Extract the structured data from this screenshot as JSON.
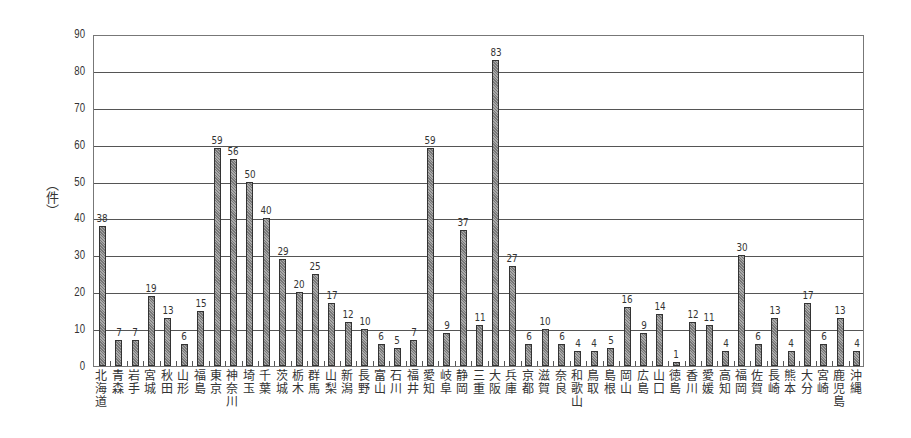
{
  "chart_data": {
    "type": "bar",
    "title": "",
    "xlabel": "",
    "ylabel": "（件）",
    "ylim": [
      0,
      90
    ],
    "yticks": [
      0,
      10,
      20,
      30,
      40,
      50,
      60,
      70,
      80,
      90
    ],
    "grid": true,
    "legend": null,
    "categories": [
      "北海道",
      "青森",
      "岩手",
      "宮城",
      "秋田",
      "山形",
      "福島",
      "東京",
      "神奈川",
      "埼玉",
      "千葉",
      "茨城",
      "栃木",
      "群馬",
      "山梨",
      "新潟",
      "長野",
      "富山",
      "石川",
      "福井",
      "愛知",
      "岐阜",
      "静岡",
      "三重",
      "大阪",
      "兵庫",
      "京都",
      "滋賀",
      "奈良",
      "和歌山",
      "鳥取",
      "島根",
      "岡山",
      "広島",
      "山口",
      "徳島",
      "香川",
      "愛媛",
      "高知",
      "福岡",
      "佐賀",
      "長崎",
      "熊本",
      "大分",
      "宮崎",
      "鹿児島",
      "沖縄"
    ],
    "values": [
      38,
      7,
      7,
      19,
      13,
      6,
      15,
      59,
      56,
      50,
      40,
      29,
      20,
      25,
      17,
      12,
      10,
      6,
      5,
      7,
      59,
      9,
      37,
      11,
      83,
      27,
      6,
      10,
      6,
      4,
      4,
      5,
      16,
      9,
      14,
      1,
      12,
      11,
      4,
      30,
      6,
      13,
      4,
      17,
      6,
      13,
      4
    ],
    "colors": {
      "bar_fill": "#8c8c8c",
      "bar_edge": "#333333",
      "grid": "#555555"
    }
  }
}
